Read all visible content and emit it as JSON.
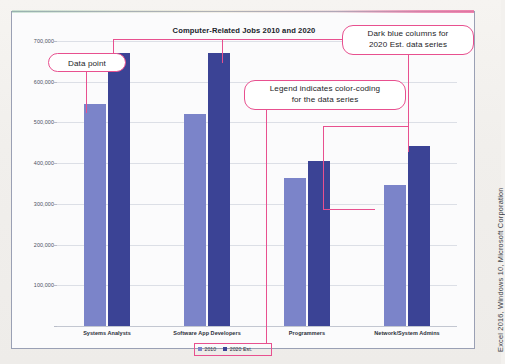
{
  "chart_data": {
    "type": "bar",
    "title": "Computer-Related Jobs 2010 and 2020",
    "xlabel": "",
    "ylabel": "",
    "ylim": [
      0,
      700000
    ],
    "ytick_step": 100000,
    "grid": true,
    "legend_position": "bottom",
    "categories": [
      "Systems Analysts",
      "Software App Developers",
      "Programmers",
      "Network/System Admins"
    ],
    "ytick_labels": [
      "700,000",
      "600,000",
      "500,000",
      "400,000",
      "300,000",
      "200,000",
      "100,000"
    ],
    "ytick_values": [
      700000,
      600000,
      500000,
      400000,
      300000,
      200000,
      100000
    ],
    "series": [
      {
        "name": "2010",
        "color": "#7b84c9",
        "values": [
          546000,
          520000,
          363000,
          347000
        ]
      },
      {
        "name": "2020 Est.",
        "color": "#3b4395",
        "values": [
          671000,
          670000,
          406000,
          443000
        ]
      }
    ]
  },
  "legend": {
    "entries": [
      {
        "label": "2010",
        "swatch_class": "s2010"
      },
      {
        "label": "2020 Est.",
        "swatch_class": "s2020"
      }
    ]
  },
  "callouts": [
    {
      "id": "data-point",
      "text": "Data point"
    },
    {
      "id": "dark-blue-columns",
      "line1": "Dark blue columns for",
      "line2": "2020 Est. data series"
    },
    {
      "id": "legend-color-coding",
      "line1": "Legend indicates color-coding",
      "line2": "for the data series"
    }
  ],
  "credit": {
    "text": "Excel 2016, Windows 10, Microsoft Corporation"
  },
  "colors": {
    "series_2010": "#7b84c9",
    "series_2020": "#3b4395",
    "callout_border": "#e8508f",
    "gridline": "#dcdfe6",
    "frame_border": "#9aa0b4",
    "plot_background": "#fbfbfc"
  }
}
